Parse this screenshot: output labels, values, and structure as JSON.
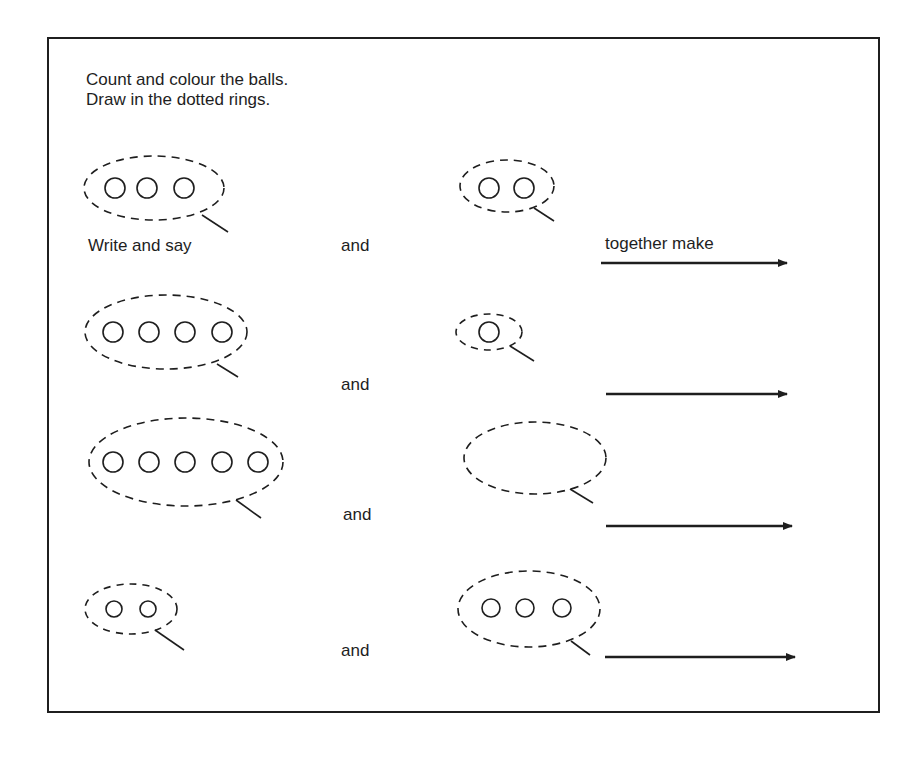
{
  "worksheet": {
    "instructions": [
      "Count and colour the balls.",
      "Draw in the dotted rings."
    ],
    "write_and_say_label": "Write and say",
    "and_label": "and",
    "together_make_label": "together make",
    "ink_color": "#1e1e1e",
    "rows": [
      {
        "left_balls": 3,
        "right_balls": 2
      },
      {
        "left_balls": 4,
        "right_balls": 1
      },
      {
        "left_balls": 5,
        "right_balls": 0
      },
      {
        "left_balls": 2,
        "right_balls": 3
      }
    ]
  }
}
